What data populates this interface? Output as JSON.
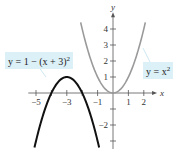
{
  "chart_data": {
    "type": "line",
    "title": "",
    "xlabel": "x",
    "ylabel": "y",
    "xlim": [
      -5.5,
      2.6
    ],
    "ylim": [
      -3.5,
      4.8
    ],
    "x_ticks": [
      -5,
      -4,
      -3,
      -2,
      -1,
      1,
      2
    ],
    "x_tick_labels": [
      "-5",
      "-3",
      "-1",
      "1",
      "2"
    ],
    "x_tick_label_values": [
      -5,
      -3,
      -1,
      1,
      2
    ],
    "y_ticks": [
      4,
      3,
      2,
      1,
      -1,
      -2,
      -3
    ],
    "y_tick_labels": [
      "4",
      "3",
      "2",
      "1",
      "-2"
    ],
    "y_tick_label_values": [
      4,
      3,
      2,
      1,
      -2
    ],
    "grid": false,
    "series": [
      {
        "name": "y = x^2",
        "label": "y = x",
        "label_sup": "2",
        "color": "#9a9a9a",
        "formula": "x^2",
        "domain": [
          -2.1,
          2.1
        ],
        "x": [
          -2.1,
          -2,
          -1.5,
          -1,
          -0.5,
          0,
          0.5,
          1,
          1.5,
          2,
          2.1
        ],
        "values": [
          4.41,
          4,
          2.25,
          1,
          0.25,
          0,
          0.25,
          1,
          2.25,
          4,
          4.41
        ]
      },
      {
        "name": "y = 1 - (x + 3)^2",
        "label": "y = 1 − (x + 3)",
        "label_sup": "2",
        "color": "#111111",
        "formula": "1-(x+3)^2",
        "domain": [
          -5.1,
          -0.9
        ],
        "x": [
          -5.1,
          -5,
          -4.5,
          -4,
          -3.5,
          -3,
          -2.5,
          -2,
          -1.5,
          -1,
          -0.9
        ],
        "values": [
          -3.41,
          -3,
          -1.25,
          0,
          0.75,
          1,
          0.75,
          0,
          -1.25,
          -3,
          -3.41
        ]
      }
    ]
  }
}
